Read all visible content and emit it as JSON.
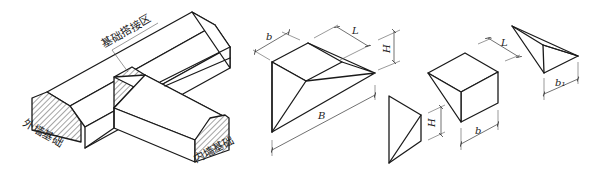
{
  "figure": {
    "left": {
      "label_overlap_zone": "基础搭接区",
      "label_outer_wall_foundation": "外墙基础",
      "label_inner_wall_foundation": "内墙基础"
    },
    "trapezoid_prism": {
      "dim_b": "b",
      "dim_L": "L",
      "dim_H": "H",
      "dim_B": "B"
    },
    "small_triangle": {
      "dim_H": "H"
    },
    "box_wedge": {
      "dim_L": "L",
      "dim_b": "b"
    },
    "pyramid": {
      "dim_b1": "b₁"
    },
    "colors": {
      "line": "#1a1a1a",
      "background": "#ffffff"
    }
  }
}
